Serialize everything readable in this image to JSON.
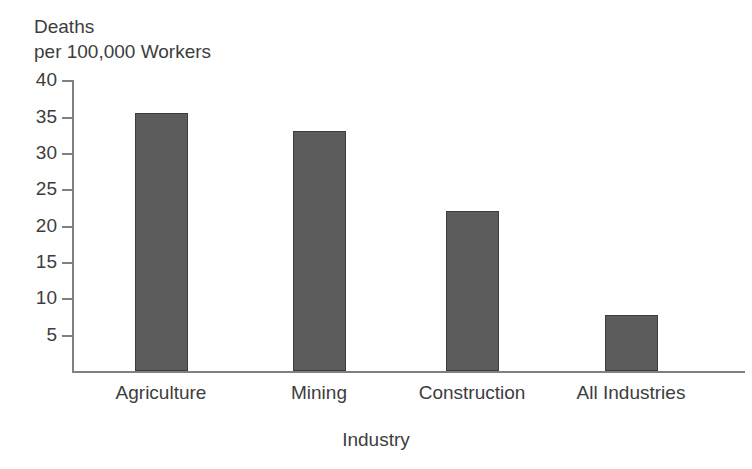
{
  "chart_data": {
    "type": "bar",
    "title": "",
    "ylabel_line1": "Deaths",
    "ylabel_line2": "per 100,000 Workers",
    "ylabel": "Deaths per 100,000 Workers",
    "xlabel": "Industry",
    "categories": [
      "Agriculture",
      "Mining",
      "Construction",
      "All Industries"
    ],
    "values": [
      35.5,
      33.0,
      22.0,
      7.7
    ],
    "ylim": [
      0,
      42
    ],
    "yticks": [
      5,
      10,
      15,
      20,
      25,
      30,
      35,
      40
    ],
    "ytick_labels": [
      "5",
      "10",
      "15",
      "20",
      "25",
      "30",
      "35",
      "40"
    ],
    "grid": false,
    "legend": false,
    "bar_color": "#5c5c5c",
    "bar_border_color": "#3c3c3c",
    "axis_color": "#808080",
    "text_color": "#3d3d3d"
  }
}
